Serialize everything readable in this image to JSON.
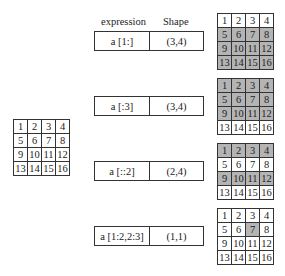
{
  "source_matrix": [
    [
      1,
      2,
      3,
      4
    ],
    [
      5,
      6,
      7,
      8
    ],
    [
      9,
      10,
      11,
      12
    ],
    [
      13,
      14,
      15,
      16
    ]
  ],
  "headers": {
    "expression": "expression",
    "shape": "Shape"
  },
  "highlight_color": "#b4b4b4",
  "rows": [
    {
      "expression": "a [1:]",
      "shape": "(3,4)",
      "highlight": [
        [
          0,
          0,
          0,
          0
        ],
        [
          1,
          1,
          1,
          1
        ],
        [
          1,
          1,
          1,
          1
        ],
        [
          1,
          1,
          1,
          1
        ]
      ]
    },
    {
      "expression": "a [:3]",
      "shape": "(3,4)",
      "highlight": [
        [
          1,
          1,
          1,
          1
        ],
        [
          1,
          1,
          1,
          1
        ],
        [
          1,
          1,
          1,
          1
        ],
        [
          0,
          0,
          0,
          0
        ]
      ]
    },
    {
      "expression": "a [::2]",
      "shape": "(2,4)",
      "highlight": [
        [
          1,
          1,
          1,
          1
        ],
        [
          0,
          0,
          0,
          0
        ],
        [
          1,
          1,
          1,
          1
        ],
        [
          0,
          0,
          0,
          0
        ]
      ]
    },
    {
      "expression": "a [1:2,2:3]",
      "shape": "(1,1)",
      "highlight": [
        [
          0,
          0,
          0,
          0
        ],
        [
          0,
          0,
          1,
          0
        ],
        [
          0,
          0,
          0,
          0
        ],
        [
          0,
          0,
          0,
          0
        ]
      ]
    }
  ]
}
